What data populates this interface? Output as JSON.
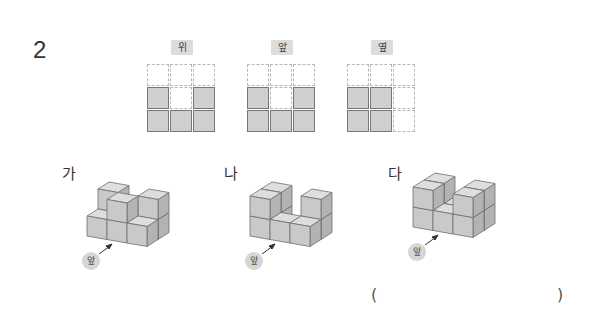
{
  "question": {
    "number": "2"
  },
  "views": [
    {
      "label": "위",
      "grid": [
        [
          0,
          0,
          0
        ],
        [
          1,
          0,
          1
        ],
        [
          1,
          1,
          1
        ]
      ]
    },
    {
      "label": "앞",
      "grid": [
        [
          0,
          0,
          0
        ],
        [
          1,
          0,
          1
        ],
        [
          1,
          1,
          1
        ]
      ]
    },
    {
      "label": "옆",
      "grid": [
        [
          0,
          0,
          0
        ],
        [
          1,
          1,
          0
        ],
        [
          1,
          1,
          0
        ]
      ]
    }
  ],
  "figures": [
    {
      "label": "가",
      "front_label": "앞"
    },
    {
      "label": "나",
      "front_label": "앞"
    },
    {
      "label": "다",
      "front_label": "앞"
    }
  ],
  "answer": {
    "open": "(",
    "close": ")",
    "value": ""
  },
  "colors": {
    "cube_front": "#c9c9c9",
    "cube_top": "#dedede",
    "cube_side": "#b3b3b3",
    "edge": "#6f6f6f"
  }
}
